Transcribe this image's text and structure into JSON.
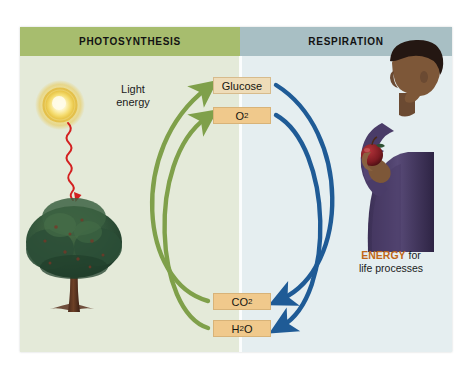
{
  "figure": {
    "headers": {
      "left": "PHOTOSYNTHESIS",
      "right": "RESPIRATION"
    },
    "molecules": [
      {
        "id": "glucose",
        "label": "Glucose",
        "formula": "",
        "color": "#eedcb8"
      },
      {
        "id": "o2",
        "label": "O",
        "formula": "2",
        "color": "#f0c98c"
      },
      {
        "id": "co2",
        "label": "CO",
        "formula": "2",
        "color": "#f0c98c"
      },
      {
        "id": "h2o",
        "label": "H",
        "formula": "2",
        "suffix": "O",
        "color": "#f0c98c"
      }
    ],
    "labels": {
      "light_energy_line1": "Light",
      "light_energy_line2": "energy",
      "energy_word": "ENERGY",
      "energy_rest": " for",
      "energy_line2": "life processes"
    },
    "illustrations": {
      "sun": "sun-icon",
      "light_ray": "red-wavy-arrow-icon",
      "tree": "apple-tree-illustration",
      "person": "person-eating-apple-illustration",
      "apple": "red-apple-icon"
    },
    "arrows": {
      "photosynthesis_color": "#7fa04a",
      "respiration_color": "#1f5b96",
      "light_ray_color": "#d32020",
      "photosynthesis_arrows": [
        {
          "from": "CO2",
          "to": "Glucose"
        },
        {
          "from": "H2O",
          "to": "O2"
        }
      ],
      "respiration_arrows": [
        {
          "from": "Glucose",
          "to": "CO2"
        },
        {
          "from": "O2",
          "to": "H2O"
        }
      ]
    },
    "colors": {
      "header_left_bg": "#a7bd6e",
      "header_right_bg": "#a8bfc4",
      "panel_left_bg": "#e4ead9",
      "panel_right_bg": "#e5eef0",
      "box_border": "#c4a068",
      "energy_accent": "#c06718"
    }
  }
}
